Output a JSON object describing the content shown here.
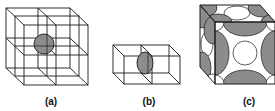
{
  "figure": {
    "panels": [
      {
        "id": "a",
        "label": "(a)",
        "description": "cubic lattice grid with a single shaded sphere at center"
      },
      {
        "id": "b",
        "label": "(b)",
        "description": "two adjacent cubic cells sharing a face with a shaded half-sphere at the shared face"
      },
      {
        "id": "c",
        "label": "(c)",
        "description": "face-centered cubic unit cell packed with spheres"
      }
    ],
    "colors": {
      "line": "#1a1a1a",
      "sphere_fill": "#8c8c8c",
      "sphere_light": "#ffffff",
      "background": "#ffffff"
    }
  }
}
